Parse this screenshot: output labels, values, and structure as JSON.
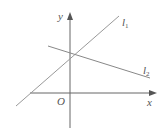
{
  "diagram": {
    "type": "coordinate-plane-lines",
    "axes": {
      "x_label": "x",
      "y_label": "y",
      "origin_label": "O"
    },
    "lines": [
      {
        "name": "l",
        "subscript": "1",
        "slope": "positive",
        "y_intercept": "positive"
      },
      {
        "name": "l",
        "subscript": "2",
        "slope": "negative",
        "y_intercept": "positive"
      }
    ],
    "colors": {
      "axis": "#555555",
      "line": "#999999",
      "text": "#555555"
    }
  }
}
